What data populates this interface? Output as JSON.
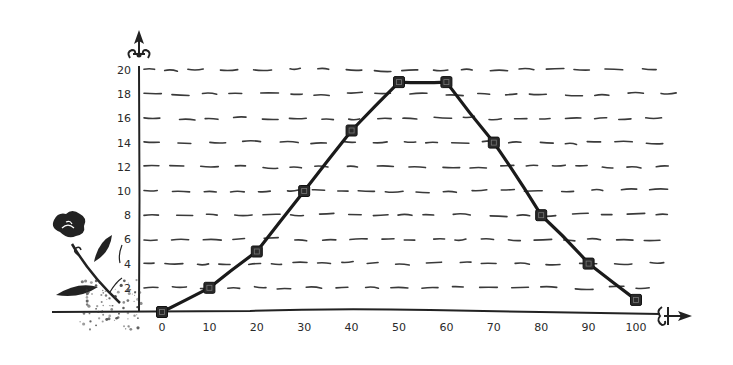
{
  "chart_data": {
    "type": "line",
    "title": "",
    "xlabel": "",
    "ylabel": "",
    "x": [
      0,
      10,
      20,
      30,
      40,
      50,
      60,
      70,
      80,
      90,
      100
    ],
    "series": [
      {
        "name": "series-1",
        "values": [
          0,
          2,
          5,
          10,
          15,
          19,
          19,
          14,
          8,
          4,
          1
        ],
        "marker": "square",
        "color": "#222222"
      }
    ],
    "x_ticks": [
      "0",
      "10",
      "20",
      "30",
      "40",
      "50",
      "60",
      "70",
      "80",
      "90",
      "100"
    ],
    "y_ticks": [
      "2",
      "4",
      "6",
      "8",
      "10",
      "12",
      "14",
      "16",
      "18",
      "20"
    ],
    "xlim": [
      0,
      100
    ],
    "ylim": [
      0,
      20
    ],
    "grid": "horizontal-dashed",
    "legend": "none",
    "style": "hand-drawn sketch",
    "decorations": [
      "rose-flower-at-origin",
      "ornate-arrow-y-axis",
      "ornate-arrow-x-axis"
    ]
  },
  "colors": {
    "ink": "#222222",
    "grid": "#3a3a3a",
    "background": "#ffffff"
  }
}
